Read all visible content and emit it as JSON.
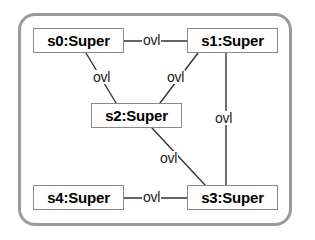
{
  "diagram": {
    "frame": {
      "shape": "rounded-rectangle"
    },
    "nodes": [
      {
        "id": "s0",
        "label": "s0:Super",
        "x": 33,
        "y": 28,
        "w": 91,
        "h": 25
      },
      {
        "id": "s1",
        "label": "s1:Super",
        "x": 187,
        "y": 28,
        "w": 91,
        "h": 25
      },
      {
        "id": "s2",
        "label": "s2:Super",
        "x": 91,
        "y": 103,
        "w": 91,
        "h": 25
      },
      {
        "id": "s4",
        "label": "s4:Super",
        "x": 33,
        "y": 185,
        "w": 91,
        "h": 25
      },
      {
        "id": "s3",
        "label": "s3:Super",
        "x": 187,
        "y": 185,
        "w": 91,
        "h": 25
      }
    ],
    "edges": [
      {
        "from": "s0",
        "to": "s1",
        "label": "ovl",
        "x1": 124,
        "y1": 41,
        "x2": 187,
        "y2": 41,
        "lx": 142,
        "ly": 33
      },
      {
        "from": "s0",
        "to": "s2",
        "label": "ovl",
        "x1": 86,
        "y1": 53,
        "x2": 116,
        "y2": 103,
        "lx": 92,
        "ly": 70
      },
      {
        "from": "s1",
        "to": "s2",
        "label": "ovl",
        "x1": 198,
        "y1": 53,
        "x2": 160,
        "y2": 103,
        "lx": 166,
        "ly": 70
      },
      {
        "from": "s1",
        "to": "s3",
        "label": "ovl",
        "x1": 226,
        "y1": 53,
        "x2": 226,
        "y2": 185,
        "lx": 214,
        "ly": 111
      },
      {
        "from": "s2",
        "to": "s3",
        "label": "ovl",
        "x1": 152,
        "y1": 128,
        "x2": 205,
        "y2": 185,
        "lx": 159,
        "ly": 151
      },
      {
        "from": "s4",
        "to": "s3",
        "label": "ovl",
        "x1": 124,
        "y1": 198,
        "x2": 187,
        "y2": 198,
        "lx": 142,
        "ly": 190
      }
    ],
    "colors": {
      "frame_border": "#9a9a9a",
      "node_border": "#8a8a8a",
      "node_fill": "#ffffff",
      "edge_line": "#333333",
      "text": "#000000"
    }
  }
}
